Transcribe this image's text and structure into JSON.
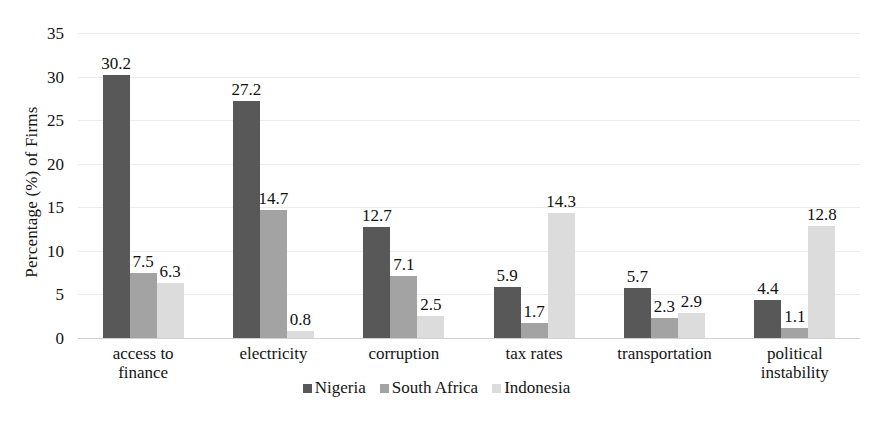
{
  "chart_data": {
    "type": "bar",
    "title": "",
    "subtitle": "",
    "xlabel": "",
    "ylabel": "Percentage (%) of Firms",
    "ylim": [
      0,
      35
    ],
    "ytick_step": 5,
    "yticks": [
      35,
      30,
      25,
      20,
      15,
      10,
      5,
      0
    ],
    "grid": true,
    "grid_axis": "y",
    "legend_position": "bottom-center",
    "orientation": "vertical",
    "grouped": true,
    "categories": [
      "access to finance",
      "electricity",
      "corruption",
      "tax rates",
      "transportation",
      "political instability"
    ],
    "category_lines": [
      [
        "access to",
        "finance"
      ],
      [
        "electricity"
      ],
      [
        "corruption"
      ],
      [
        "tax rates"
      ],
      [
        "transportation"
      ],
      [
        "political",
        "instability"
      ]
    ],
    "series": [
      {
        "name": "Nigeria",
        "color": "#585858",
        "values": [
          30.2,
          27.2,
          12.7,
          5.9,
          5.7,
          4.4
        ],
        "labels": [
          "30.2",
          "27.2",
          "12.7",
          "5.9",
          "5.7",
          "4.4"
        ]
      },
      {
        "name": "South Africa",
        "color": "#a3a3a3",
        "values": [
          7.5,
          14.7,
          7.1,
          1.7,
          2.3,
          1.1
        ],
        "labels": [
          "7.5",
          "14.7",
          "7.1",
          "1.7",
          "2.3",
          "1.1"
        ]
      },
      {
        "name": "Indonesia",
        "color": "#dcdcdc",
        "values": [
          6.3,
          0.8,
          2.5,
          14.3,
          2.9,
          12.8
        ],
        "labels": [
          "6.3",
          "0.8",
          "2.5",
          "14.3",
          "2.9",
          "12.8"
        ]
      }
    ]
  },
  "legend": {
    "items": [
      {
        "label": "Nigeria",
        "color": "#585858"
      },
      {
        "label": "South Africa",
        "color": "#a3a3a3"
      },
      {
        "label": "Indonesia",
        "color": "#dcdcdc"
      }
    ]
  },
  "colors": {
    "series_nigeria": "#585858",
    "series_south_africa": "#a3a3a3",
    "series_indonesia": "#dcdcdc",
    "gridline": "#ececec",
    "axis": "#d2d2d2",
    "text": "#141414",
    "background": "#ffffff"
  }
}
